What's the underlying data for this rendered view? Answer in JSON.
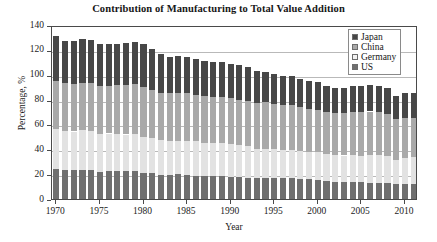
{
  "chart_data": {
    "type": "bar",
    "stacked": true,
    "title": "Contribution of Manufacturing to Total Value Addition",
    "xlabel": "Year",
    "ylabel": "Percentage, %",
    "ylim": [
      0,
      140
    ],
    "ytick_values": [
      0,
      20,
      40,
      60,
      80,
      100,
      120,
      140
    ],
    "ytick_labels": [
      "0",
      "20",
      "40",
      "60",
      "80",
      "100",
      "120",
      "140"
    ],
    "xtick_values": [
      1970,
      1975,
      1980,
      1985,
      1990,
      1995,
      2000,
      2005,
      2010
    ],
    "xtick_labels": [
      "1970",
      "1975",
      "1980",
      "1985",
      "1990",
      "1995",
      "2000",
      "2005",
      "2010"
    ],
    "grid": true,
    "legend_position": "top-right",
    "categories": [
      "1970",
      "1971",
      "1972",
      "1973",
      "1974",
      "1975",
      "1976",
      "1977",
      "1978",
      "1979",
      "1980",
      "1981",
      "1982",
      "1983",
      "1984",
      "1985",
      "1986",
      "1987",
      "1988",
      "1989",
      "1990",
      "1991",
      "1992",
      "1993",
      "1994",
      "1995",
      "1996",
      "1997",
      "1998",
      "1999",
      "2000",
      "2001",
      "2002",
      "2003",
      "2004",
      "2005",
      "2006",
      "2007",
      "2008",
      "2009",
      "2010",
      "2011"
    ],
    "stack_order_bottom_to_top": [
      "US",
      "Germany",
      "China",
      "Japan"
    ],
    "series": [
      {
        "name": "US",
        "color": "#6f6f6f",
        "values": [
          24.0,
          23.2,
          23.3,
          23.7,
          23.1,
          22.0,
          22.3,
          22.4,
          22.3,
          22.3,
          21.0,
          20.6,
          19.6,
          19.5,
          19.8,
          19.2,
          18.9,
          18.6,
          18.6,
          18.3,
          17.9,
          17.4,
          17.2,
          17.1,
          17.1,
          17.0,
          16.8,
          16.7,
          16.3,
          15.8,
          15.5,
          14.4,
          14.0,
          13.7,
          13.6,
          13.4,
          13.2,
          12.9,
          12.5,
          12.0,
          12.3,
          12.4
        ]
      },
      {
        "name": "Germany",
        "color": "#e2e2e2",
        "values": [
          32.0,
          31.5,
          31.0,
          31.5,
          31.8,
          30.0,
          30.4,
          30.0,
          29.6,
          29.8,
          29.0,
          28.4,
          27.5,
          27.0,
          27.2,
          27.5,
          27.4,
          26.7,
          26.5,
          26.8,
          26.5,
          26.2,
          25.2,
          23.5,
          23.3,
          23.0,
          22.5,
          22.6,
          22.6,
          22.2,
          22.3,
          22.1,
          21.5,
          21.3,
          21.6,
          21.6,
          22.2,
          22.4,
          22.0,
          19.5,
          20.8,
          21.1
        ]
      },
      {
        "name": "China",
        "color": "#a9a9a9",
        "values": [
          39.0,
          38.5,
          38.0,
          38.5,
          38.4,
          38.7,
          38.4,
          39.0,
          40.0,
          40.2,
          40.0,
          39.0,
          38.5,
          38.4,
          38.0,
          38.2,
          37.5,
          37.4,
          37.2,
          36.8,
          36.6,
          36.4,
          36.8,
          37.0,
          37.5,
          36.8,
          36.2,
          36.0,
          35.2,
          34.6,
          34.0,
          33.5,
          33.7,
          34.0,
          34.6,
          34.8,
          35.0,
          34.6,
          34.2,
          33.0,
          32.2,
          31.8
        ]
      },
      {
        "name": "Japan",
        "color": "#474747",
        "values": [
          36.0,
          34.0,
          34.5,
          35.0,
          35.0,
          34.0,
          33.5,
          33.0,
          33.5,
          34.0,
          34.5,
          33.0,
          31.0,
          29.5,
          30.0,
          29.5,
          28.5,
          28.0,
          28.0,
          28.0,
          28.0,
          27.5,
          26.8,
          25.5,
          24.5,
          24.0,
          23.5,
          23.5,
          22.8,
          22.0,
          22.0,
          20.6,
          20.3,
          20.5,
          21.0,
          21.0,
          21.2,
          21.0,
          20.3,
          18.5,
          20.0,
          19.8
        ]
      }
    ],
    "totals": [
      131.0,
      127.2,
      126.8,
      128.7,
      128.3,
      124.7,
      124.6,
      124.4,
      125.4,
      126.3,
      124.5,
      121.0,
      116.6,
      114.4,
      115.0,
      114.4,
      112.3,
      110.7,
      110.3,
      109.9,
      109.0,
      107.5,
      106.0,
      103.1,
      102.4,
      100.8,
      99.0,
      98.8,
      96.9,
      94.6,
      93.8,
      90.6,
      89.5,
      89.5,
      90.8,
      90.8,
      91.6,
      90.9,
      89.0,
      83.0,
      85.3,
      85.1
    ]
  },
  "legend": {
    "items": [
      {
        "label": "Japan",
        "color": "#474747"
      },
      {
        "label": "China",
        "color": "#a9a9a9"
      },
      {
        "label": "Germany",
        "color": "#f2f2f2"
      },
      {
        "label": "US",
        "color": "#6f6f6f"
      }
    ]
  }
}
